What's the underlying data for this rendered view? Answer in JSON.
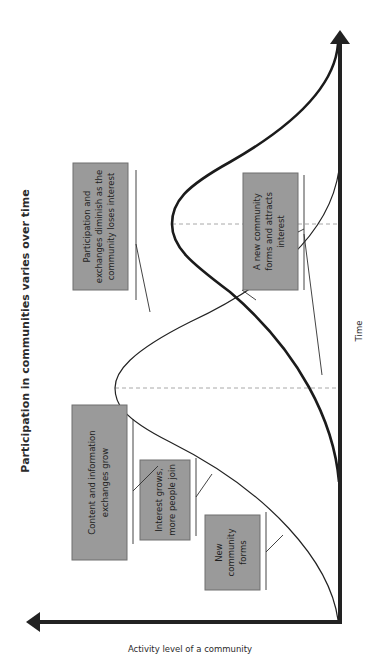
{
  "diagram": {
    "title": "Participation in communities varies over time",
    "x_axis_label": "Time",
    "y_axis_label": "Activity level of a community",
    "orientation": "rotated-90-ccw",
    "colors": {
      "axis": "#222222",
      "box_fill": "#9a9a9a",
      "box_border": "#6f6f6f",
      "dashed_guides": "#a8a8a8",
      "text": "#2b2b2b"
    },
    "curves": [
      {
        "name": "first-community",
        "style": "thin",
        "description": "Rises, peaks, then declines"
      },
      {
        "name": "second-community",
        "style": "thick",
        "description": "Rises later as first declines, peaks later"
      }
    ],
    "callouts": [
      {
        "id": "new-community",
        "lines": [
          "New",
          "community",
          "forms"
        ]
      },
      {
        "id": "interest-grows",
        "lines": [
          "Interest grows,",
          "more people join"
        ]
      },
      {
        "id": "content-grows",
        "lines": [
          "Content and information",
          "exchanges grow"
        ]
      },
      {
        "id": "participation-diminish",
        "lines": [
          "Participation and",
          "exchanges diminish as the",
          "community loses interest"
        ]
      },
      {
        "id": "new-community-attracts",
        "lines": [
          "A new community",
          "forms and attracts",
          "interest"
        ]
      }
    ]
  }
}
